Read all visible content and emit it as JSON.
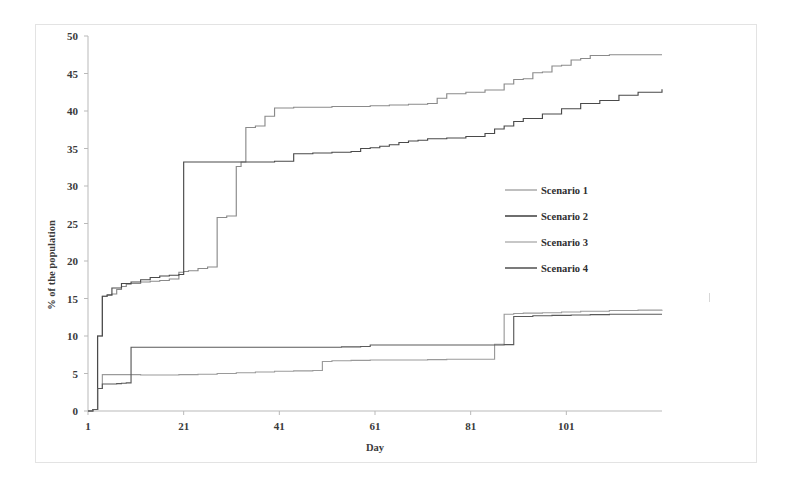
{
  "figure": {
    "background_color": "#ffffff",
    "frame_border_color": "#e3e3e3"
  },
  "axes": {
    "x_title": "Day",
    "y_title": "% of the population",
    "x_ticks": [
      "1",
      "21",
      "41",
      "61",
      "81",
      "101"
    ],
    "y_ticks": [
      "0",
      "5",
      "10",
      "15",
      "20",
      "25",
      "30",
      "35",
      "40",
      "45",
      "50"
    ],
    "axis_color": "#b9b9b9",
    "label_color": "#3a3a3a"
  },
  "legend": {
    "position": "middle-right",
    "entries": [
      {
        "label": "Scenario 1",
        "color": "#8a8a8a"
      },
      {
        "label": "Scenario 2",
        "color": "#4a4a4a"
      },
      {
        "label": "Scenario 3",
        "color": "#9a9a9a"
      },
      {
        "label": "Scenario 4",
        "color": "#5a5a5a"
      }
    ]
  },
  "chart_data": {
    "type": "line",
    "title": "",
    "subtitle": "",
    "xlabel": "Day",
    "ylabel": "% of the population",
    "xlim": [
      1,
      121
    ],
    "ylim": [
      0,
      50
    ],
    "xticks": [
      1,
      21,
      41,
      61,
      81,
      101
    ],
    "yticks": [
      0,
      5,
      10,
      15,
      20,
      25,
      30,
      35,
      40,
      45,
      50
    ],
    "grid": false,
    "legend_position": "middle-right",
    "step_style": "post",
    "series": [
      {
        "name": "Scenario 1",
        "color": "#8a8a8a",
        "x": [
          1,
          2,
          3,
          4,
          5,
          6,
          7,
          8,
          9,
          10,
          12,
          14,
          16,
          18,
          20,
          21,
          22,
          24,
          26,
          28,
          30,
          32,
          33,
          34,
          36,
          38,
          40,
          44,
          48,
          52,
          56,
          60,
          64,
          68,
          72,
          74,
          76,
          80,
          84,
          88,
          90,
          92,
          94,
          96,
          98,
          100,
          102,
          104,
          106,
          110,
          114,
          118,
          121
        ],
        "y": [
          0,
          0.2,
          10.0,
          15.3,
          15.4,
          15.6,
          16.2,
          16.6,
          16.9,
          17.0,
          17.2,
          17.3,
          17.4,
          17.6,
          18.5,
          18.6,
          18.7,
          19.0,
          19.2,
          25.8,
          26.0,
          32.6,
          33.2,
          37.8,
          38.0,
          39.3,
          40.4,
          40.5,
          40.5,
          40.6,
          40.6,
          40.7,
          40.8,
          40.9,
          41.0,
          41.7,
          42.3,
          42.5,
          42.8,
          43.6,
          44.2,
          44.3,
          45.1,
          45.2,
          46.0,
          46.1,
          46.8,
          47.0,
          47.4,
          47.5,
          47.5,
          47.5,
          47.5
        ]
      },
      {
        "name": "Scenario 2",
        "color": "#4a4a4a",
        "x": [
          1,
          2,
          3,
          4,
          5,
          6,
          8,
          10,
          12,
          14,
          16,
          18,
          20,
          21,
          22,
          30,
          40,
          44,
          48,
          52,
          56,
          58,
          60,
          62,
          64,
          66,
          68,
          70,
          72,
          76,
          80,
          84,
          86,
          88,
          90,
          92,
          96,
          100,
          104,
          108,
          112,
          116,
          121
        ],
        "y": [
          0,
          0.2,
          10.0,
          15.3,
          15.5,
          16.4,
          17.0,
          17.2,
          17.5,
          17.8,
          18.0,
          18.1,
          18.2,
          33.2,
          33.2,
          33.2,
          33.3,
          34.3,
          34.4,
          34.5,
          34.6,
          35.0,
          35.1,
          35.3,
          35.5,
          35.8,
          36.0,
          36.1,
          36.3,
          36.4,
          36.6,
          37.0,
          37.6,
          38.0,
          38.6,
          39.0,
          39.6,
          40.3,
          41.0,
          41.4,
          42.1,
          42.5,
          42.9
        ]
      },
      {
        "name": "Scenario 3",
        "color": "#9a9a9a",
        "x": [
          1,
          2,
          3,
          4,
          8,
          10,
          12,
          16,
          20,
          24,
          28,
          32,
          36,
          40,
          44,
          48,
          50,
          52,
          56,
          60,
          64,
          68,
          72,
          76,
          80,
          84,
          86,
          88,
          90,
          92,
          96,
          100,
          104,
          110,
          116,
          121
        ],
        "y": [
          0,
          0.2,
          3.0,
          4.85,
          4.85,
          4.85,
          4.8,
          4.8,
          4.85,
          4.9,
          5.0,
          5.1,
          5.2,
          5.3,
          5.35,
          5.4,
          6.6,
          6.7,
          6.75,
          6.8,
          6.8,
          6.8,
          6.85,
          6.9,
          6.9,
          6.9,
          8.9,
          12.9,
          13.0,
          13.05,
          13.1,
          13.2,
          13.3,
          13.4,
          13.45,
          13.5
        ]
      },
      {
        "name": "Scenario 4",
        "color": "#5a5a5a",
        "x": [
          1,
          2,
          3,
          4,
          5,
          6,
          7,
          8,
          9,
          10,
          14,
          18,
          22,
          26,
          30,
          34,
          38,
          42,
          46,
          50,
          54,
          58,
          60,
          62,
          66,
          70,
          74,
          78,
          82,
          86,
          88,
          90,
          94,
          98,
          102,
          106,
          110,
          116,
          121
        ],
        "y": [
          0,
          0.2,
          3.0,
          3.6,
          3.6,
          3.6,
          3.65,
          3.7,
          3.75,
          8.5,
          8.5,
          8.5,
          8.5,
          8.5,
          8.5,
          8.5,
          8.5,
          8.5,
          8.5,
          8.5,
          8.55,
          8.6,
          8.8,
          8.8,
          8.8,
          8.8,
          8.8,
          8.8,
          8.8,
          8.8,
          8.85,
          12.6,
          12.7,
          12.75,
          12.8,
          12.85,
          12.9,
          12.9,
          12.9
        ]
      }
    ]
  }
}
